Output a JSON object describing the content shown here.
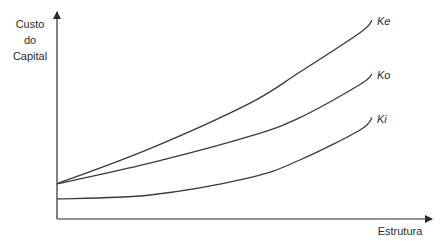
{
  "chart_data": {
    "type": "line",
    "title": "",
    "xlabel": "Estrutura",
    "ylabel": [
      "Custo",
      "do",
      "Capital"
    ],
    "xlim": [
      0,
      10.7
    ],
    "ylim": [
      0,
      10.2
    ],
    "grid": false,
    "ticks": false,
    "legend": "inline-right-end",
    "series": [
      {
        "name": "Ke",
        "x": [
          0,
          2.95,
          6.13,
          7.71,
          9.62,
          10
        ],
        "y": [
          1.7,
          3.4,
          5.6,
          7.1,
          9.0,
          9.6
        ]
      },
      {
        "name": "Ko",
        "x": [
          0,
          2.95,
          6.13,
          7.71,
          9.62,
          10
        ],
        "y": [
          1.7,
          2.7,
          4.0,
          4.9,
          6.5,
          7.0
        ]
      },
      {
        "name": "Ki",
        "x": [
          0,
          2.95,
          6.13,
          7.71,
          9.62,
          10
        ],
        "y": [
          0.97,
          1.16,
          2.0,
          2.85,
          4.3,
          4.9
        ]
      }
    ]
  }
}
